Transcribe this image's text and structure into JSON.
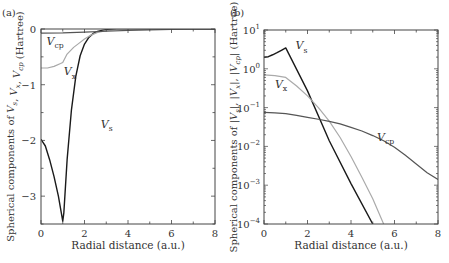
{
  "chart_data": [
    {
      "panel": "(a)",
      "type": "line",
      "xlabel": "Radial distance (a.u.)",
      "ylabel": "Spherical components of V_s, V_x, V_cp (Hartree)",
      "xlim": [
        0,
        8
      ],
      "ylim": [
        -3.5,
        0
      ],
      "yscale": "linear",
      "xticks": [
        0,
        2,
        4,
        6,
        8
      ],
      "yticks": [
        0,
        -1,
        -2,
        -3
      ],
      "grid": false,
      "series": [
        {
          "name": "V_s",
          "label": "V",
          "sub": "s",
          "color": "#1a1a1a",
          "width": 1.4,
          "x": [
            0,
            0.2,
            0.4,
            0.6,
            0.8,
            1.0,
            1.05,
            1.2,
            1.4,
            1.6,
            1.8,
            2.0,
            2.2,
            2.4,
            2.6,
            2.8,
            3.0,
            3.3,
            3.6,
            4.0,
            5.0,
            6.0,
            8.0
          ],
          "y": [
            -1.98,
            -2.1,
            -2.35,
            -2.65,
            -3.0,
            -3.45,
            -3.3,
            -2.35,
            -1.45,
            -0.85,
            -0.48,
            -0.27,
            -0.15,
            -0.08,
            -0.045,
            -0.025,
            -0.014,
            -0.007,
            -0.004,
            -0.002,
            0,
            0,
            0
          ]
        },
        {
          "name": "V_x",
          "label": "V",
          "sub": "x",
          "color": "#a8a8a8",
          "width": 1.2,
          "x": [
            0,
            0.3,
            0.6,
            0.9,
            1.0,
            1.2,
            1.5,
            1.8,
            2.0,
            2.3,
            2.6,
            3.0,
            3.5,
            4.0,
            8.0
          ],
          "y": [
            -0.7,
            -0.7,
            -0.67,
            -0.62,
            -0.6,
            -0.45,
            -0.33,
            -0.24,
            -0.18,
            -0.11,
            -0.06,
            -0.03,
            -0.01,
            -0.005,
            0
          ]
        },
        {
          "name": "V_cp",
          "label": "V",
          "sub": "cp",
          "color": "#555555",
          "width": 1.2,
          "x": [
            0,
            1,
            2,
            3,
            4,
            5,
            6,
            7,
            8
          ],
          "y": [
            -0.075,
            -0.07,
            -0.055,
            -0.04,
            -0.025,
            -0.015,
            -0.008,
            -0.003,
            -0.0015
          ]
        }
      ],
      "annotations": [
        {
          "text": "V",
          "sub": "cp",
          "x": 0.25,
          "y": -0.28
        },
        {
          "text": "V",
          "sub": "x",
          "x": 1.05,
          "y": -0.83
        },
        {
          "text": "V",
          "sub": "s",
          "x": 2.75,
          "y": -1.78
        }
      ]
    },
    {
      "panel": "(b)",
      "type": "line",
      "xlabel": "Radial distance (a.u.)",
      "ylabel": "Spherical components of |V_s|, |V_x|, |V_cp| (Hartree)",
      "xlim": [
        0,
        8
      ],
      "ylim": [
        0.0001,
        10
      ],
      "yscale": "log",
      "xticks": [
        0,
        2,
        4,
        6,
        8
      ],
      "yticks": [
        10,
        1,
        0.1,
        0.01,
        0.001,
        0.0001
      ],
      "ytick_labels": [
        {
          "base": "10",
          "exp": "1"
        },
        {
          "base": "10",
          "exp": "0"
        },
        {
          "base": "10",
          "exp": "−1"
        },
        {
          "base": "10",
          "exp": "−2"
        },
        {
          "base": "10",
          "exp": "−3"
        },
        {
          "base": "10",
          "exp": "−4"
        }
      ],
      "grid": false,
      "series": [
        {
          "name": "|V_s|",
          "label": "V",
          "sub": "s",
          "color": "#1a1a1a",
          "width": 1.4,
          "x": [
            0,
            0.2,
            0.4,
            0.6,
            0.8,
            1.0,
            2.0,
            3.0,
            4.0,
            5.0
          ],
          "y": [
            1.98,
            2.05,
            2.3,
            2.6,
            3.0,
            3.45,
            0.27,
            0.014,
            0.0011,
            0.0001
          ]
        },
        {
          "name": "|V_x|",
          "label": "V",
          "sub": "x",
          "color": "#aaaaaa",
          "width": 1.2,
          "x": [
            0,
            0.5,
            1.0,
            1.5,
            2.0,
            2.5,
            3.0,
            3.5,
            4.0,
            4.5,
            5.0,
            5.5
          ],
          "y": [
            0.7,
            0.67,
            0.6,
            0.36,
            0.2,
            0.1,
            0.045,
            0.017,
            0.0055,
            0.0016,
            0.00045,
            0.0001
          ]
        },
        {
          "name": "|V_cp|",
          "label": "V",
          "sub": "cp",
          "color": "#555555",
          "width": 1.2,
          "x": [
            0,
            0.5,
            1.0,
            1.5,
            2.0,
            2.5,
            3.0,
            3.5,
            4.0,
            4.5,
            5.0,
            5.5,
            6.0,
            6.5,
            7.0,
            7.5,
            8.0
          ],
          "y": [
            0.075,
            0.073,
            0.07,
            0.063,
            0.056,
            0.05,
            0.044,
            0.038,
            0.031,
            0.025,
            0.019,
            0.014,
            0.0095,
            0.0059,
            0.0035,
            0.0021,
            0.0014
          ]
        }
      ],
      "annotations": [
        {
          "text": "V",
          "sub": "s",
          "x": 1.45,
          "y": 3.2
        },
        {
          "text": "V",
          "sub": "x",
          "x": 0.5,
          "y": 0.32
        },
        {
          "text": "V",
          "sub": "cp",
          "x": 5.2,
          "y": 0.014
        }
      ]
    }
  ],
  "panels": [
    {
      "tag": "(a)",
      "xlabel": "Radial distance (a.u.)"
    },
    {
      "tag": "(b)",
      "xlabel": "Radial distance (a.u.)"
    }
  ]
}
